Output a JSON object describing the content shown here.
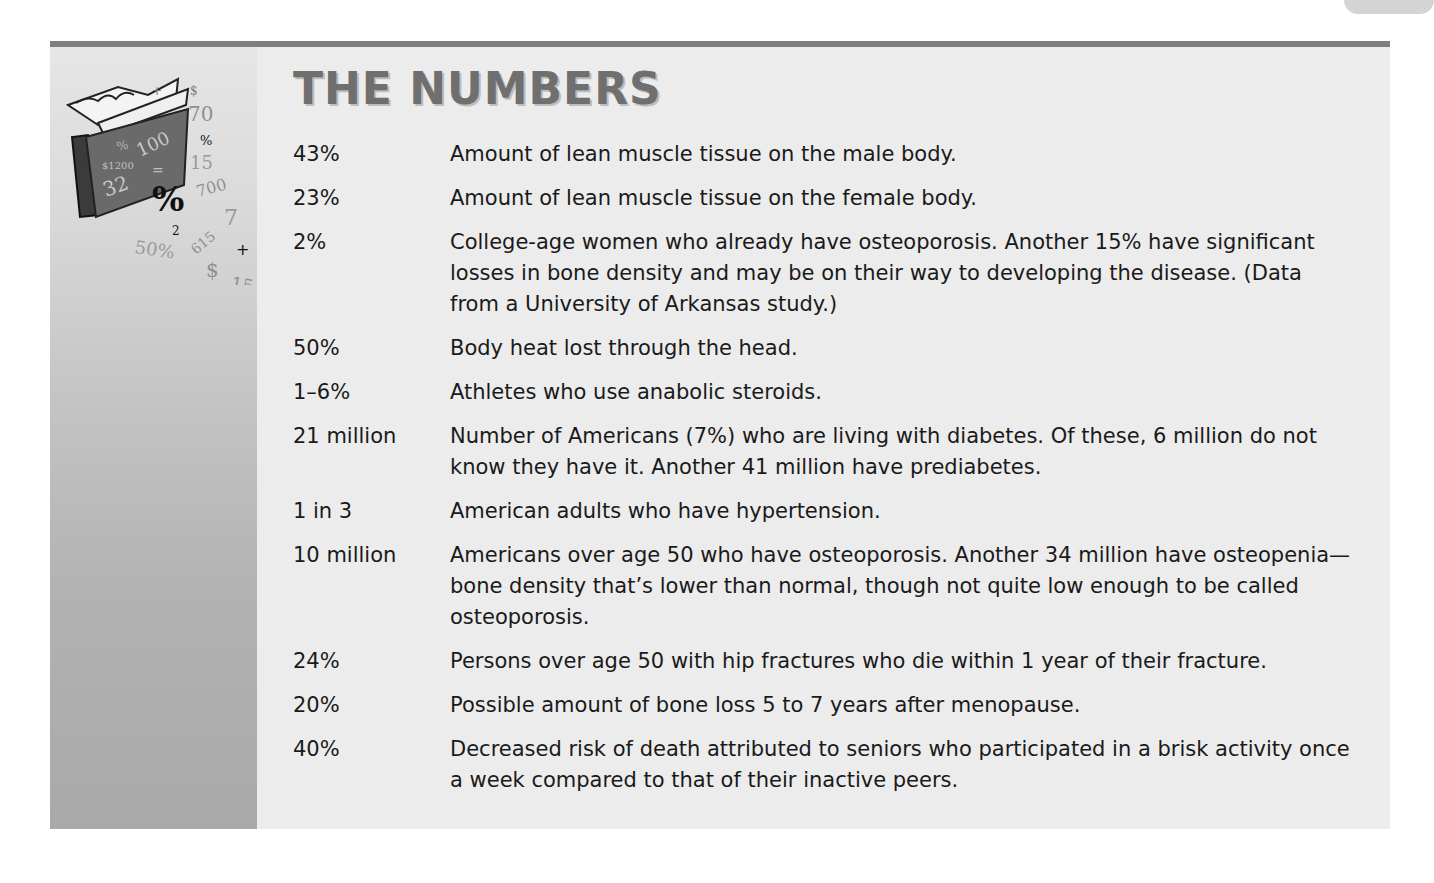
{
  "section": {
    "title": "THE NUMBERS",
    "colors": {
      "rule": "#7f7f7f",
      "box_background": "#ececec",
      "title": "#6f6f6f",
      "side_column_top": "#e6e6e6",
      "side_column_bottom": "#a9a9a9"
    },
    "illustration": {
      "icon": "folder-with-numbers-icon",
      "glyphs": [
        "+",
        "$",
        "70",
        "%",
        "100",
        "%",
        "$1200",
        "=",
        "15",
        "32",
        "%",
        "700",
        "2",
        "7",
        "50%",
        "615",
        "+",
        "$",
        "15"
      ]
    },
    "rows": [
      {
        "number": "43%",
        "description": "Amount of lean muscle tissue on the male body."
      },
      {
        "number": "23%",
        "description": "Amount of lean muscle tissue on the female body."
      },
      {
        "number": "2%",
        "description": "College-age women who already have osteoporosis. Another 15% have significant losses in bone density and may be on their way to developing the disease. (Data from a University of Arkansas study.)"
      },
      {
        "number": "50%",
        "description": "Body heat lost through the head."
      },
      {
        "number": "1–6%",
        "description": "Athletes who use anabolic steroids."
      },
      {
        "number": "21 million",
        "description": "Number of Americans (7%) who are living with diabetes. Of these, 6 million do not know they have it. Another 41 million have prediabetes."
      },
      {
        "number": "1 in 3",
        "description": "American adults who have hypertension."
      },
      {
        "number": "10 million",
        "description": "Americans over age 50 who have osteoporosis. Another 34 million have osteopenia—bone density that’s lower than normal, though not quite low enough to be called osteoporosis."
      },
      {
        "number": "24%",
        "description": "Persons over age 50 with hip fractures who die within 1 year of their fracture."
      },
      {
        "number": "20%",
        "description": "Possible amount of bone loss 5 to 7 years after menopause."
      },
      {
        "number": "40%",
        "description": "Decreased risk of death attributed to seniors who participated in a brisk activity once a week compared to that of their inactive peers."
      }
    ]
  }
}
